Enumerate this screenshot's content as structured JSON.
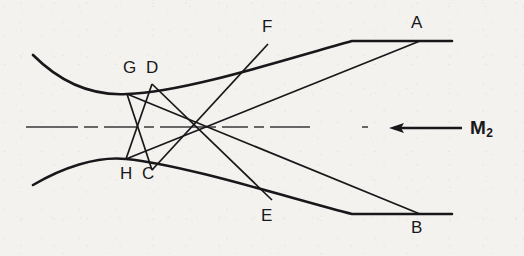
{
  "figure": {
    "kind": "optical-ray-diagram",
    "background_color": "#f3f2ef",
    "ink_color": "#18171a",
    "width": 524,
    "height": 256
  },
  "labels": {
    "a": "A",
    "b": "B",
    "f": "F",
    "e": "E",
    "gd": "G D",
    "hc": "H C",
    "g": "G",
    "d": "D",
    "h": "H",
    "c": "C",
    "m2_letter": "M",
    "m2_subscript": "2"
  },
  "annotations": {
    "arrow_name": "incoming-direction-arrow",
    "axis_name": "optical-axis-centerline"
  },
  "geometry": {
    "upper_envelope": "M 33 55 C 60 82 92 96 127 94 C 186 92 290 58 352 41 L 452 41",
    "lower_envelope": "M 33 185 C 62 168 96 156 126 159 C 186 165 296 200 352 214 L 452 214",
    "centerline_start_x": 26,
    "centerline_end_x": 378,
    "centerline_y": 127,
    "rays": [
      {
        "name": "ray-G-to-B",
        "x1": 127,
        "y1": 94,
        "x2": 420,
        "y2": 214
      },
      {
        "name": "ray-D-to-E",
        "x1": 152,
        "y1": 84,
        "x2": 272,
        "y2": 200
      },
      {
        "name": "ray-H-to-A",
        "x1": 126,
        "y1": 159,
        "x2": 420,
        "y2": 41
      },
      {
        "name": "ray-C-to-F",
        "x1": 152,
        "y1": 170,
        "x2": 268,
        "y2": 44
      },
      {
        "name": "ray-G-to-C",
        "x1": 127,
        "y1": 94,
        "x2": 152,
        "y2": 170
      },
      {
        "name": "ray-D-to-H",
        "x1": 152,
        "y1": 84,
        "x2": 126,
        "y2": 159
      }
    ],
    "arrow": {
      "tail_x": 462,
      "tip_x": 389,
      "y": 128
    }
  }
}
